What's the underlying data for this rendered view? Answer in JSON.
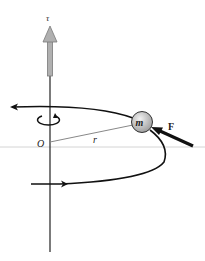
{
  "diagram": {
    "labels": {
      "torque": "τ",
      "origin": "O",
      "radius": "r",
      "mass": "m",
      "force": "F"
    },
    "colors": {
      "torque_arrow": "#9a9a9a",
      "axis": "#222222",
      "horizontal_line": "#d0d0d0",
      "path": "#111111",
      "radius_line": "#888888",
      "mass_fill_light": "#e6e6e6",
      "mass_fill_dark": "#a8a8a8",
      "force_arrow": "#111111"
    },
    "icons": {
      "rotation": "counterclockwise-rotation-icon"
    }
  }
}
